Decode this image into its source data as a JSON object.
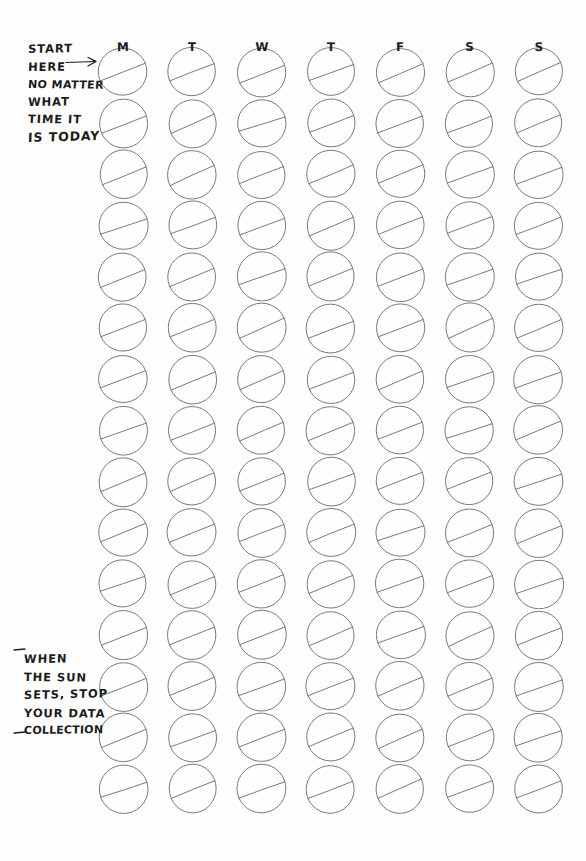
{
  "page": {
    "background_color": "#fefefe",
    "ink_color": "#1c1c1c",
    "line_color": "#6b6b6b"
  },
  "annotations": {
    "start_note": {
      "name": "start-here-instruction",
      "lines": [
        "START",
        "HERE",
        "NO MATTER",
        "WHAT",
        "TIME IT",
        "IS TODAY"
      ],
      "arrow": "right-arrow"
    },
    "sunset_note": {
      "name": "sunset-stop-instruction",
      "lines": [
        "WHEN",
        "THE SUN",
        "SETS, STOP",
        "YOUR DATA",
        "COLLECTION"
      ],
      "marks": [
        "dash-top",
        "dash-bottom"
      ]
    }
  },
  "grid": {
    "columns": [
      {
        "id": "col-monday",
        "label": "M"
      },
      {
        "id": "col-tuesday",
        "label": "T"
      },
      {
        "id": "col-wednesday",
        "label": "W"
      },
      {
        "id": "col-thursday",
        "label": "T"
      },
      {
        "id": "col-friday",
        "label": "F"
      },
      {
        "id": "col-saturday",
        "label": "S"
      },
      {
        "id": "col-sunday",
        "label": "S"
      }
    ],
    "rows": 15,
    "cell": {
      "shape": "circle-with-diagonal",
      "diameter": 48,
      "first_center_x": 123,
      "first_center_y": 72,
      "column_pitch": 69.3,
      "row_pitch": 51.2,
      "stroke_width": 0.9,
      "diagonal": {
        "from_angle_deg": 203,
        "to_angle_deg": 20
      }
    },
    "header_y": 40,
    "total_cells": 105
  }
}
